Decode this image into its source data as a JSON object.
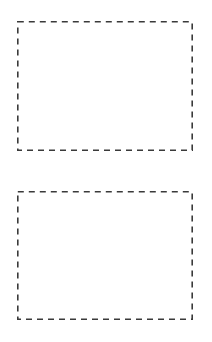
{
  "canvas": {
    "width": 212,
    "height": 342,
    "background": "#ffffff"
  },
  "style": {
    "stroke_color": "#3a3a3a",
    "stroke_width": 1.6,
    "dash_pattern": "6,5"
  },
  "boxes": [
    {
      "x": 17,
      "y": 21,
      "width": 176,
      "height": 130,
      "label": ""
    },
    {
      "x": 17,
      "y": 191,
      "width": 176,
      "height": 129,
      "label": ""
    }
  ]
}
